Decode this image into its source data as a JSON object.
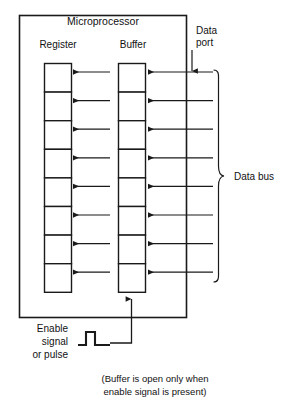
{
  "diagram": {
    "title": "Microprocessor",
    "columns": {
      "register_label": "Register",
      "buffer_label": "Buffer"
    },
    "data_port": {
      "line1": "Data",
      "line2": "port",
      "arrow_icon": "down-arrow-icon"
    },
    "data_bus": {
      "label": "Data bus",
      "brace_icon": "right-curly-brace-icon",
      "line_count": 8
    },
    "enable": {
      "line1": "Enable",
      "line2": "signal",
      "line3": "or pulse",
      "pulse_icon": "square-pulse-icon",
      "arrow_icon": "up-arrow-icon"
    },
    "caption": {
      "line1": "(Buffer is open only when",
      "line2": "enable signal is present)"
    },
    "register_cells": [
      {
        "index": 1
      },
      {
        "index": 2
      },
      {
        "index": 3
      },
      {
        "index": 4
      },
      {
        "index": 5
      },
      {
        "index": 6
      },
      {
        "index": 7
      },
      {
        "index": 8
      }
    ],
    "buffer_cells": [
      {
        "index": 1
      },
      {
        "index": 2
      },
      {
        "index": 3
      },
      {
        "index": 4
      },
      {
        "index": 5
      },
      {
        "index": 6
      },
      {
        "index": 7
      },
      {
        "index": 8
      }
    ],
    "colors": {
      "ink": "#1a1a1a",
      "background": "#ffffff"
    }
  }
}
